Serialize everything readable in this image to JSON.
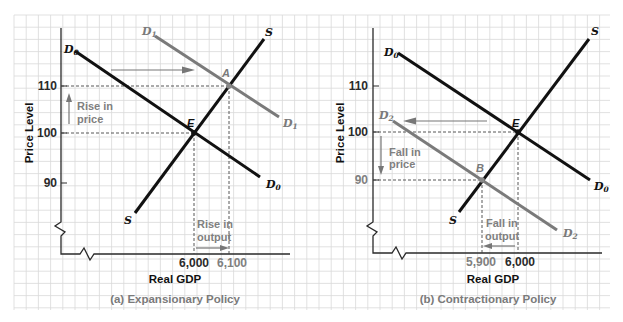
{
  "figure": {
    "colors": {
      "grid": "#d9d9d9",
      "dark_curve": "#111111",
      "gray_curve": "#7a7a7a",
      "annotation": "#808080"
    },
    "panels": [
      {
        "caption": "(a) Expansionary Policy",
        "x_axis_title": "Real GDP",
        "y_axis_title": "Price Level",
        "y_ticks": [
          "110",
          "100",
          "90"
        ],
        "x_ticks": [
          "6,000",
          "6,100"
        ],
        "curves": {
          "supply_top": "S",
          "supply_bottom": "S",
          "demand_initial_top": "D",
          "demand_initial_top_sub": "0",
          "demand_initial_bottom": "D",
          "demand_initial_bottom_sub": "0",
          "demand_new_top": "D",
          "demand_new_top_sub": "1",
          "demand_new_bottom": "D",
          "demand_new_bottom_sub": "1"
        },
        "points": {
          "initial": "E",
          "new": "A"
        },
        "annotations": {
          "price_line1": "Rise in",
          "price_line2": "price",
          "output_line1": "Rise in",
          "output_line2": "output"
        }
      },
      {
        "caption": "(b) Contractionary Policy",
        "x_axis_title": "Real GDP",
        "y_axis_title": "Price Level",
        "y_ticks": [
          "110",
          "100",
          "90"
        ],
        "x_ticks": [
          "5,900",
          "6,000"
        ],
        "curves": {
          "supply_top": "S",
          "supply_bottom": "S",
          "demand_initial_top": "D",
          "demand_initial_top_sub": "0",
          "demand_initial_bottom": "D",
          "demand_initial_bottom_sub": "0",
          "demand_new_top": "D",
          "demand_new_top_sub": "2",
          "demand_new_bottom": "D",
          "demand_new_bottom_sub": "2"
        },
        "points": {
          "initial": "E",
          "new": "B"
        },
        "annotations": {
          "price_line1": "Fall in",
          "price_line2": "price",
          "output_line1": "Fall in",
          "output_line2": "output"
        }
      }
    ]
  }
}
